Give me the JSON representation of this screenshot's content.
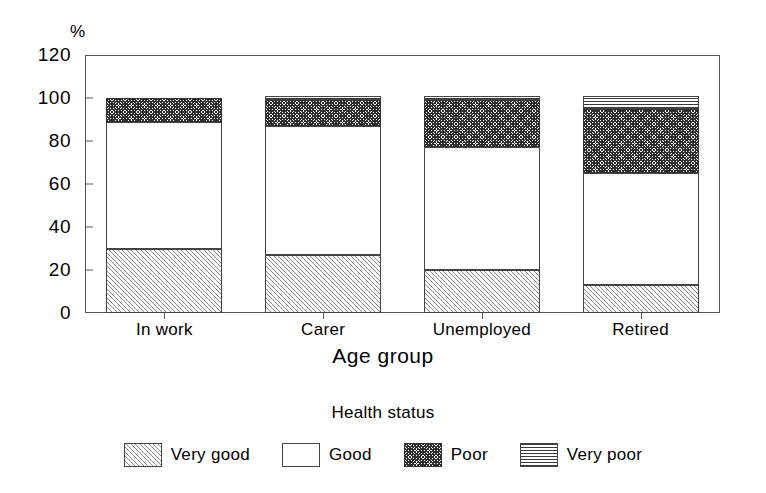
{
  "chart_data": {
    "type": "bar",
    "subtype": "stacked-bar",
    "title": "",
    "xlabel": "Age group",
    "ylabel": "%",
    "ylim": [
      0,
      120
    ],
    "ytick_labels": [
      "0",
      "20",
      "40",
      "60",
      "80",
      "100",
      "120"
    ],
    "ytick_values": [
      0,
      20,
      40,
      60,
      80,
      100,
      120
    ],
    "grid": false,
    "legend_title": "Health status",
    "legend_position": "bottom",
    "categories": [
      "In work",
      "Carer",
      "Unemployed",
      "Retired"
    ],
    "series": [
      {
        "name": "Very good",
        "pattern": "diagonal-hatch",
        "values": [
          30,
          27,
          20,
          13
        ]
      },
      {
        "name": "Good",
        "pattern": "solid-white",
        "values": [
          59,
          60,
          57,
          52
        ]
      },
      {
        "name": "Poor",
        "pattern": "dark-crosshatch",
        "values": [
          11,
          12,
          22,
          30
        ]
      },
      {
        "name": "Very poor",
        "pattern": "horizontal-lines",
        "values": [
          0,
          2,
          2,
          6
        ]
      }
    ]
  },
  "axis": {
    "percent_symbol": "%",
    "x_title": "Age group",
    "y_ticks": [
      "120",
      "100",
      "80",
      "60",
      "40",
      "20",
      "0"
    ]
  },
  "legend": {
    "title": "Health status",
    "items": [
      {
        "label": "Very good"
      },
      {
        "label": "Good"
      },
      {
        "label": "Poor"
      },
      {
        "label": "Very poor"
      }
    ]
  }
}
